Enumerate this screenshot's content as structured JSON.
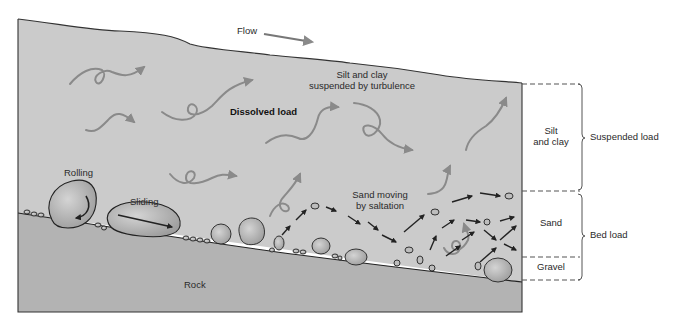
{
  "labels": {
    "flow": "Flow",
    "silt_clay_turbulence_line1": "Silt and clay",
    "silt_clay_turbulence_line2": "suspended by turbulence",
    "dissolved_load": "Dissolved load",
    "rolling": "Rolling",
    "sliding": "Sliding",
    "saltation_line1": "Sand moving",
    "saltation_line2": "by saltation",
    "rock": "Rock"
  },
  "layers": [
    {
      "name": "Silt and clay",
      "line1": "Silt",
      "line2": "and clay"
    },
    {
      "name": "Sand",
      "line1": "Sand"
    },
    {
      "name": "Gravel",
      "line1": "Gravel"
    }
  ],
  "brackets": {
    "suspended_load": "Suspended load",
    "bed_load": "Bed load"
  },
  "colors": {
    "water": "#c9c9c9",
    "rock": "#b5b5b5",
    "outline": "#333333",
    "swirl": "#8a8a8a",
    "dashed": "#555555",
    "background": "#ffffff"
  }
}
